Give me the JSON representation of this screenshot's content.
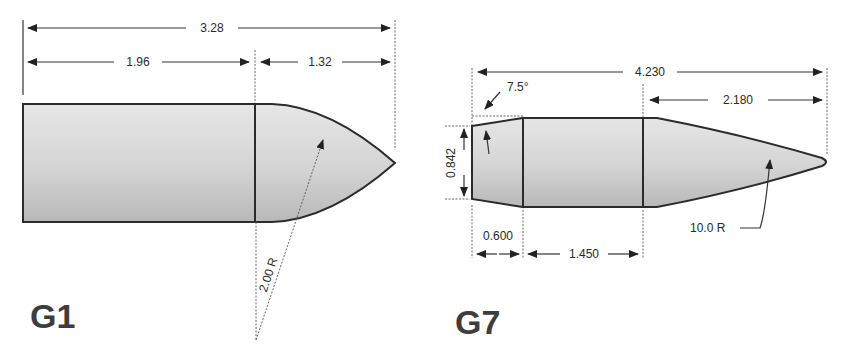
{
  "diagrams": [
    {
      "name": "G1",
      "label": "G1",
      "dimensions": {
        "overall_length": "3.28",
        "body_length": "1.96",
        "nose_length": "1.32",
        "ogive_radius": "2.00 R"
      }
    },
    {
      "name": "G7",
      "label": "G7",
      "dimensions": {
        "overall_length": "4.230",
        "boattail_angle": "7.5°",
        "nose_length": "2.180",
        "base_diameter": "0.842",
        "boattail_length": "0.600",
        "body_length": "1.450",
        "ogive_radius": "10.0 R"
      }
    }
  ],
  "colors": {
    "fill_light": "#e3e3e3",
    "fill_dark": "#b5b5b5",
    "outline": "#2b2b2b",
    "text": "#2a2a2a",
    "label": "#3d3d3d"
  }
}
